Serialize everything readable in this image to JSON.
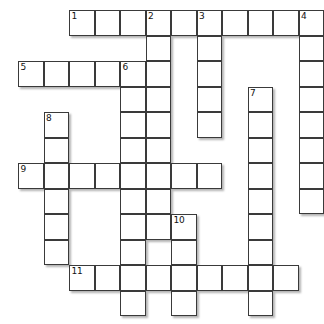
{
  "puzzle": {
    "title": "Crossword Puzzle Grid",
    "type": "crossword-grid",
    "cell_size": 25.5,
    "origin_x": 18,
    "origin_y": 10,
    "columns": 12,
    "rows": 12,
    "cell_fill_color": "#ffffff",
    "cell_border_color": "#3a3a3a",
    "background_color": "#ffffff",
    "number_color": "#111111",
    "entries_across": [
      {
        "number": "1",
        "row": 0,
        "col": 2,
        "length": 10
      },
      {
        "number": "5",
        "row": 2,
        "col": 0,
        "length": 5
      },
      {
        "number": "9",
        "row": 6,
        "col": 0,
        "length": 8
      },
      {
        "number": "11",
        "row": 10,
        "col": 2,
        "length": 9
      }
    ],
    "entries_down": [
      {
        "number": "2",
        "row": 0,
        "col": 5,
        "length": 9
      },
      {
        "number": "3",
        "row": 0,
        "col": 7,
        "length": 5
      },
      {
        "number": "4",
        "row": 0,
        "col": 11,
        "length": 8
      },
      {
        "number": "6",
        "row": 2,
        "col": 4,
        "length": 10
      },
      {
        "number": "7",
        "row": 3,
        "col": 9,
        "length": 9
      },
      {
        "number": "8",
        "row": 4,
        "col": 1,
        "length": 6
      },
      {
        "number": "10",
        "row": 8,
        "col": 6,
        "length": 4
      }
    ],
    "numbered_cells": [
      {
        "number": "1",
        "row": 0,
        "col": 2
      },
      {
        "number": "2",
        "row": 0,
        "col": 5
      },
      {
        "number": "3",
        "row": 0,
        "col": 7
      },
      {
        "number": "4",
        "row": 0,
        "col": 11
      },
      {
        "number": "5",
        "row": 2,
        "col": 0
      },
      {
        "number": "6",
        "row": 2,
        "col": 4
      },
      {
        "number": "7",
        "row": 3,
        "col": 9
      },
      {
        "number": "8",
        "row": 4,
        "col": 1
      },
      {
        "number": "9",
        "row": 6,
        "col": 0
      },
      {
        "number": "10",
        "row": 8,
        "col": 6
      },
      {
        "number": "11",
        "row": 10,
        "col": 2
      }
    ],
    "cells": [
      {
        "row": 0,
        "col": 2
      },
      {
        "row": 0,
        "col": 3
      },
      {
        "row": 0,
        "col": 4
      },
      {
        "row": 0,
        "col": 5
      },
      {
        "row": 0,
        "col": 6
      },
      {
        "row": 0,
        "col": 7
      },
      {
        "row": 0,
        "col": 8
      },
      {
        "row": 0,
        "col": 9
      },
      {
        "row": 0,
        "col": 10
      },
      {
        "row": 0,
        "col": 11
      },
      {
        "row": 1,
        "col": 5
      },
      {
        "row": 1,
        "col": 7
      },
      {
        "row": 1,
        "col": 11
      },
      {
        "row": 2,
        "col": 0
      },
      {
        "row": 2,
        "col": 1
      },
      {
        "row": 2,
        "col": 2
      },
      {
        "row": 2,
        "col": 3
      },
      {
        "row": 2,
        "col": 4
      },
      {
        "row": 2,
        "col": 5
      },
      {
        "row": 2,
        "col": 7
      },
      {
        "row": 2,
        "col": 11
      },
      {
        "row": 3,
        "col": 4
      },
      {
        "row": 3,
        "col": 5
      },
      {
        "row": 3,
        "col": 7
      },
      {
        "row": 3,
        "col": 9
      },
      {
        "row": 3,
        "col": 11
      },
      {
        "row": 4,
        "col": 1
      },
      {
        "row": 4,
        "col": 4
      },
      {
        "row": 4,
        "col": 5
      },
      {
        "row": 4,
        "col": 7
      },
      {
        "row": 4,
        "col": 9
      },
      {
        "row": 4,
        "col": 11
      },
      {
        "row": 5,
        "col": 1
      },
      {
        "row": 5,
        "col": 4
      },
      {
        "row": 5,
        "col": 5
      },
      {
        "row": 5,
        "col": 9
      },
      {
        "row": 5,
        "col": 11
      },
      {
        "row": 6,
        "col": 0
      },
      {
        "row": 6,
        "col": 1
      },
      {
        "row": 6,
        "col": 2
      },
      {
        "row": 6,
        "col": 3
      },
      {
        "row": 6,
        "col": 4
      },
      {
        "row": 6,
        "col": 5
      },
      {
        "row": 6,
        "col": 6
      },
      {
        "row": 6,
        "col": 7
      },
      {
        "row": 6,
        "col": 9
      },
      {
        "row": 6,
        "col": 11
      },
      {
        "row": 7,
        "col": 1
      },
      {
        "row": 7,
        "col": 4
      },
      {
        "row": 7,
        "col": 5
      },
      {
        "row": 7,
        "col": 9
      },
      {
        "row": 7,
        "col": 11
      },
      {
        "row": 8,
        "col": 1
      },
      {
        "row": 8,
        "col": 4
      },
      {
        "row": 8,
        "col": 5
      },
      {
        "row": 8,
        "col": 6
      },
      {
        "row": 8,
        "col": 9
      },
      {
        "row": 9,
        "col": 1
      },
      {
        "row": 9,
        "col": 4
      },
      {
        "row": 9,
        "col": 6
      },
      {
        "row": 9,
        "col": 9
      },
      {
        "row": 10,
        "col": 2
      },
      {
        "row": 10,
        "col": 3
      },
      {
        "row": 10,
        "col": 4
      },
      {
        "row": 10,
        "col": 5
      },
      {
        "row": 10,
        "col": 6
      },
      {
        "row": 10,
        "col": 7
      },
      {
        "row": 10,
        "col": 8
      },
      {
        "row": 10,
        "col": 9
      },
      {
        "row": 10,
        "col": 10
      },
      {
        "row": 11,
        "col": 4
      },
      {
        "row": 11,
        "col": 6
      },
      {
        "row": 11,
        "col": 9
      }
    ]
  }
}
